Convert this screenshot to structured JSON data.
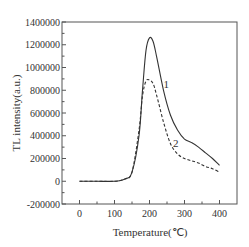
{
  "chart_data": {
    "type": "line",
    "title": "",
    "xlabel": "Temperature(℃)",
    "ylabel": "TL intensity(a.u.)",
    "xlim": [
      -50,
      450
    ],
    "ylim": [
      -200000,
      1400000
    ],
    "x_ticks": [
      "0",
      "100",
      "200",
      "300",
      "400"
    ],
    "y_ticks": [
      "1400000",
      "1200000",
      "1000000",
      "800000",
      "600000",
      "400000",
      "200000",
      "0",
      "-200000"
    ],
    "grid": false,
    "legend": "inline curve labels",
    "series": [
      {
        "name": "1",
        "style": "solid",
        "x": [
          0,
          50,
          100,
          130,
          150,
          170,
          180,
          190,
          200,
          210,
          220,
          240,
          260,
          280,
          300,
          320,
          340,
          360,
          380,
          400
        ],
        "y": [
          0,
          0,
          0,
          20000,
          80000,
          400000,
          800000,
          1150000,
          1260000,
          1230000,
          1100000,
          800000,
          580000,
          450000,
          370000,
          340000,
          300000,
          250000,
          200000,
          140000
        ]
      },
      {
        "name": "2",
        "style": "dashed",
        "x": [
          0,
          50,
          100,
          130,
          150,
          170,
          180,
          190,
          200,
          210,
          220,
          240,
          260,
          280,
          300,
          320,
          340,
          360,
          380,
          400
        ],
        "y": [
          0,
          0,
          0,
          20000,
          80000,
          450000,
          750000,
          880000,
          890000,
          860000,
          760000,
          520000,
          330000,
          240000,
          200000,
          180000,
          160000,
          130000,
          110000,
          80000
        ]
      }
    ],
    "annotations": [
      {
        "text": "1",
        "x": 248,
        "y": 820000
      },
      {
        "text": "2",
        "x": 275,
        "y": 300000
      }
    ]
  }
}
